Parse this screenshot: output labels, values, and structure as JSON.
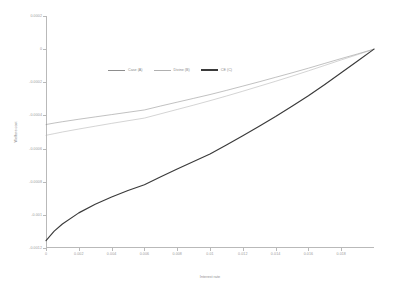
{
  "chart_data": {
    "type": "line",
    "title": "",
    "xlabel": "Interest rate",
    "ylabel": "Welfare cost",
    "xlim": [
      0,
      0.02
    ],
    "ylim": [
      -0.0012,
      0.0002
    ],
    "grid": false,
    "legend_position": "upper center",
    "x_ticks": [
      0,
      0.002,
      0.004,
      0.006,
      0.008,
      0.01,
      0.012,
      0.014,
      0.016,
      0.018
    ],
    "x_tick_labels": [
      "0",
      "0.002",
      "0.004",
      "0.006",
      "0.008",
      "0.01",
      "0.012",
      "0.014",
      "0.016",
      "0.018"
    ],
    "y_ticks": [
      0.0002,
      0,
      -0.0002,
      -0.0004,
      -0.0006,
      -0.0008,
      -0.001,
      -0.0012
    ],
    "y_tick_labels": [
      "0.0002",
      "0",
      "-0.0002",
      "-0.0004",
      "-0.0006",
      "-0.0008",
      "-0.001",
      "-0.0012"
    ],
    "x": [
      0,
      0.0005,
      0.001,
      0.002,
      0.003,
      0.004,
      0.005,
      0.006,
      0.007,
      0.008,
      0.009,
      0.01,
      0.011,
      0.012,
      0.013,
      0.014,
      0.015,
      0.016,
      0.017,
      0.018,
      0.019,
      0.02
    ],
    "series": [
      {
        "name": "Case (A)",
        "color": "#8d8d8d",
        "width": 0.55,
        "values": [
          -0.000455,
          -0.000446,
          -0.000438,
          -0.000423,
          -0.000409,
          -0.000395,
          -0.000381,
          -0.000367,
          -0.000343,
          -0.00032,
          -0.000297,
          -0.000274,
          -0.000249,
          -0.000223,
          -0.000197,
          -0.00017,
          -0.000143,
          -0.000115,
          -8.6e-05,
          -5.7e-05,
          -2.9e-05,
          0
        ]
      },
      {
        "name": "Divine (B)",
        "color": "#b0b0b0",
        "width": 0.55,
        "values": [
          -0.00052,
          -0.00051,
          -0.0005,
          -0.000482,
          -0.000465,
          -0.000448,
          -0.000432,
          -0.000416,
          -0.00039,
          -0.000364,
          -0.000338,
          -0.000311,
          -0.000283,
          -0.000254,
          -0.000224,
          -0.000194,
          -0.000163,
          -0.000131,
          -9.8e-05,
          -6.5e-05,
          -3.3e-05,
          0
        ]
      },
      {
        "name": "CE (C)",
        "color": "#3a3a3a",
        "width": 1.15,
        "values": [
          -0.001155,
          -0.001098,
          -0.001055,
          -0.000988,
          -0.000936,
          -0.000892,
          -0.000853,
          -0.000818,
          -0.00077,
          -0.000723,
          -0.000678,
          -0.000633,
          -0.000578,
          -0.000522,
          -0.000465,
          -0.000407,
          -0.000345,
          -0.000281,
          -0.000213,
          -0.000143,
          -7.2e-05,
          0
        ]
      }
    ]
  },
  "legend": {
    "entries": [
      {
        "label": "Case (A)"
      },
      {
        "label": "Divine (B)"
      },
      {
        "label": "CE (C)"
      }
    ]
  }
}
